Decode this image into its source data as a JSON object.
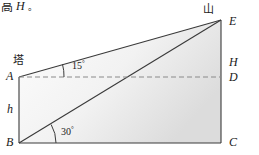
{
  "figure": {
    "type": "geometry-diagram",
    "top_note": {
      "cjk_fragment": "高",
      "italic_symbol": "H",
      "period": "。"
    },
    "labels": {
      "tower": "塔",
      "mountain": "山",
      "point_a": "A",
      "point_b": "B",
      "point_c": "C",
      "point_d": "D",
      "point_e": "E",
      "point_h": "H",
      "height_h": "h"
    },
    "angles": {
      "upper": {
        "value": "15",
        "degree": "°",
        "at_point": "A"
      },
      "lower": {
        "value": "30",
        "degree": "°",
        "at_point": "B"
      }
    },
    "colors": {
      "line": "#3a3a3a",
      "dashed": "#8a8a8a",
      "fill_light": "#fafafa",
      "fill_dark": "#dcdcdc",
      "text": "#1a1a1a",
      "background": "#ffffff"
    },
    "geometry": {
      "a": [
        19,
        77
      ],
      "b": [
        19,
        143
      ],
      "c": [
        221,
        143
      ],
      "d": [
        221,
        77
      ],
      "e": [
        221,
        20
      ]
    }
  }
}
